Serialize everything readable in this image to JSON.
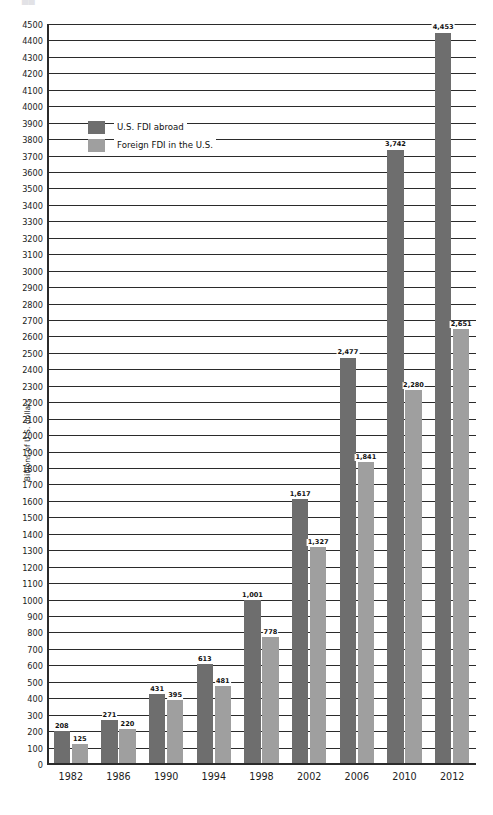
{
  "title_remnant": "██",
  "legend": {
    "position": "inside-top-left",
    "entries": [
      {
        "label": "U.S. FDI abroad",
        "swatch": "dark-gray-swatch-icon",
        "color": "#6e6e6e"
      },
      {
        "label": "Foreign FDI in the U.S.",
        "swatch": "light-gray-swatch-icon",
        "color": "#9f9f9f"
      }
    ]
  },
  "colors": {
    "series_1": "#6e6e6e",
    "series_2": "#9f9f9f",
    "gridline": "#2b2b2b",
    "axis": "#2b2b2b",
    "text": "#1c1c1c",
    "background": "#ffffff"
  },
  "chart_data": {
    "type": "bar",
    "title": "",
    "xlabel": "",
    "ylabel": "Billions of U.S. dollars",
    "ylim": [
      0,
      4500
    ],
    "ytick_step": 100,
    "grid": true,
    "legend_position": "inside-top-left",
    "categories": [
      "1982",
      "1986",
      "1990",
      "1994",
      "1998",
      "2002",
      "2006",
      "2010",
      "2012"
    ],
    "ytick_labels": [
      "0",
      "100",
      "200",
      "300",
      "400",
      "500",
      "600",
      "700",
      "800",
      "900",
      "1000",
      "1100",
      "1200",
      "1300",
      "1400",
      "1500",
      "1600",
      "1700",
      "1800",
      "1900",
      "2000",
      "2100",
      "2200",
      "2300",
      "2400",
      "2500",
      "2600",
      "2700",
      "2800",
      "2900",
      "3000",
      "3100",
      "3200",
      "3300",
      "3400",
      "3500",
      "3600",
      "3700",
      "3800",
      "3900",
      "4000",
      "4100",
      "4200",
      "4300",
      "4400",
      "4500"
    ],
    "series": [
      {
        "name": "U.S. FDI abroad",
        "color": "#6e6e6e",
        "values": [
          208,
          271,
          431,
          613,
          1001,
          1617,
          2477,
          3742,
          4453
        ],
        "labels": [
          "208",
          "271",
          "431",
          "613",
          "1,001",
          "1,617",
          "2,477",
          "3,742",
          "4,453"
        ]
      },
      {
        "name": "Foreign FDI in the U.S.",
        "color": "#9f9f9f",
        "values": [
          125,
          220,
          395,
          481,
          778,
          1327,
          1841,
          2280,
          2651
        ],
        "labels": [
          "125",
          "220",
          "395",
          "481",
          "778",
          "1,327",
          "1,841",
          "2,280",
          "2,651"
        ]
      }
    ]
  }
}
